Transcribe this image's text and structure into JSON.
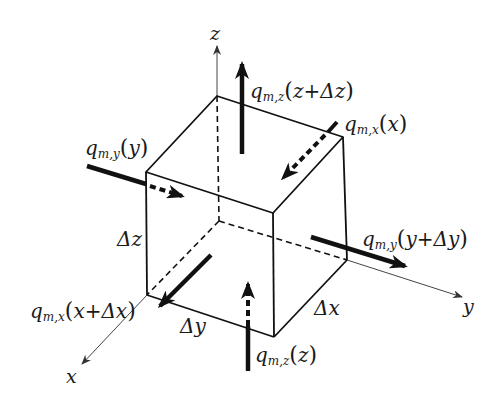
{
  "diagram": {
    "type": "control-volume-cube",
    "axes": {
      "x": {
        "label": "x"
      },
      "y": {
        "label": "y"
      },
      "z": {
        "label": "z"
      }
    },
    "dimensions": {
      "dx": "Δx",
      "dy": "Δy",
      "dz": "Δz"
    },
    "fluxes": {
      "z_in": {
        "q": "q",
        "sub": "m,z",
        "arg": "z"
      },
      "z_out": {
        "q": "q",
        "sub": "m,z",
        "arg": "z+Δz"
      },
      "x_in": {
        "q": "q",
        "sub": "m,x",
        "arg": "x"
      },
      "x_out": {
        "q": "q",
        "sub": "m,x",
        "arg": "x+Δx"
      },
      "y_in": {
        "q": "q",
        "sub": "m,y",
        "arg": "y"
      },
      "y_out": {
        "q": "q",
        "sub": "m,y",
        "arg": "y+Δy"
      }
    },
    "colors": {
      "stroke": "#111111",
      "axis": "#444444",
      "background": "#ffffff"
    }
  }
}
